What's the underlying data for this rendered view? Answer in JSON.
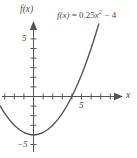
{
  "chart_data": {
    "type": "line",
    "title": "",
    "equation_label": "f(x) = 0.25x² − 4",
    "equation_parts": {
      "fx": "f(x)",
      "equals": " = ",
      "coefficient": "0.25",
      "variable": "x",
      "exponent": "2",
      "constant": " − 4"
    },
    "function": "f(x) = 0.25x^2 - 4",
    "xlabel": "x",
    "ylabel": "f(x)",
    "xlim": [
      -5,
      9
    ],
    "ylim": [
      -6.5,
      7
    ],
    "grid": false,
    "legend": false,
    "x_ticks": [
      -4,
      -3,
      -2,
      -1,
      1,
      2,
      3,
      4,
      5,
      6,
      7,
      8
    ],
    "y_ticks": [
      -5,
      -4,
      -3,
      -2,
      -1,
      1,
      2,
      3,
      4,
      5,
      6
    ],
    "x_tick_labels": [
      {
        "value": 5,
        "text": "5"
      }
    ],
    "y_tick_labels": [
      {
        "value": 5,
        "text": "5"
      },
      {
        "value": -5,
        "text": "−5"
      }
    ],
    "x_intercepts": [
      4
    ],
    "y_intercept": -4,
    "vertex": [
      0,
      -4
    ],
    "curve_domain": [
      -4,
      7
    ],
    "curve_points": [
      {
        "x": -4,
        "y": 0
      },
      {
        "x": -3.5,
        "y": -0.9375
      },
      {
        "x": -3,
        "y": -1.75
      },
      {
        "x": -2.5,
        "y": -2.4375
      },
      {
        "x": -2,
        "y": -3
      },
      {
        "x": -1.5,
        "y": -3.4375
      },
      {
        "x": -1,
        "y": -3.75
      },
      {
        "x": -0.5,
        "y": -3.9375
      },
      {
        "x": 0,
        "y": -4
      },
      {
        "x": 0.5,
        "y": -3.9375
      },
      {
        "x": 1,
        "y": -3.75
      },
      {
        "x": 1.5,
        "y": -3.4375
      },
      {
        "x": 2,
        "y": -3
      },
      {
        "x": 2.5,
        "y": -2.4375
      },
      {
        "x": 3,
        "y": -1.75
      },
      {
        "x": 3.5,
        "y": -0.9375
      },
      {
        "x": 4,
        "y": 0
      },
      {
        "x": 4.5,
        "y": 1.0625
      },
      {
        "x": 5,
        "y": 2.25
      },
      {
        "x": 5.5,
        "y": 3.5625
      },
      {
        "x": 6,
        "y": 5
      },
      {
        "x": 6.5,
        "y": 6.5625
      },
      {
        "x": 6.8,
        "y": 7.56
      }
    ],
    "colors": {
      "curve": "#555555",
      "axis": "#555555",
      "text": "#4a4a4a",
      "background": "#ffffff"
    }
  }
}
